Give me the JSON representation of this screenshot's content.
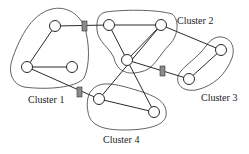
{
  "diagram": {
    "type": "clustered-network-graph",
    "colors": {
      "background": "#ffffff",
      "line": "#2a2a2a",
      "gateway_fill": "#8a8a8a"
    },
    "clusters": [
      {
        "id": "c1",
        "label": "Cluster 1"
      },
      {
        "id": "c2",
        "label": "Cluster 2"
      },
      {
        "id": "c3",
        "label": "Cluster 3"
      },
      {
        "id": "c4",
        "label": "Cluster 4"
      }
    ],
    "nodes": [
      {
        "id": "n1",
        "cluster": "c1",
        "x": 55,
        "y": 26
      },
      {
        "id": "n2",
        "cluster": "c1",
        "x": 27,
        "y": 67
      },
      {
        "id": "n3",
        "cluster": "c1",
        "x": 72,
        "y": 67
      },
      {
        "id": "n5",
        "cluster": "c2",
        "x": 109,
        "y": 25
      },
      {
        "id": "n6",
        "cluster": "c2",
        "x": 161,
        "y": 25
      },
      {
        "id": "n7",
        "cluster": "c2",
        "x": 127,
        "y": 60
      },
      {
        "id": "n8",
        "cluster": "c3",
        "x": 221,
        "y": 50
      },
      {
        "id": "n9",
        "cluster": "c3",
        "x": 189,
        "y": 79
      },
      {
        "id": "n10",
        "cluster": "c4",
        "x": 99,
        "y": 99
      },
      {
        "id": "n11",
        "cluster": "c4",
        "x": 154,
        "y": 112
      }
    ],
    "edges": [
      [
        "n1",
        "n2"
      ],
      [
        "n2",
        "n3"
      ],
      [
        "n1",
        "n5"
      ],
      [
        "n5",
        "n6"
      ],
      [
        "n5",
        "n7"
      ],
      [
        "n6",
        "n7"
      ],
      [
        "n6",
        "n8"
      ],
      [
        "n7",
        "n9"
      ],
      [
        "n8",
        "n9"
      ],
      [
        "n6",
        "n10"
      ],
      [
        "n7",
        "n11"
      ],
      [
        "n10",
        "n11"
      ],
      [
        "n2",
        "n10"
      ]
    ],
    "gateways": [
      {
        "id": "g1",
        "between": [
          "c1",
          "c2"
        ],
        "x": 85,
        "y": 26
      },
      {
        "id": "g2",
        "between": [
          "c2",
          "c3"
        ],
        "x": 163,
        "y": 72
      },
      {
        "id": "g3",
        "between": [
          "c1",
          "c4"
        ],
        "x": 80,
        "y": 93
      }
    ]
  }
}
